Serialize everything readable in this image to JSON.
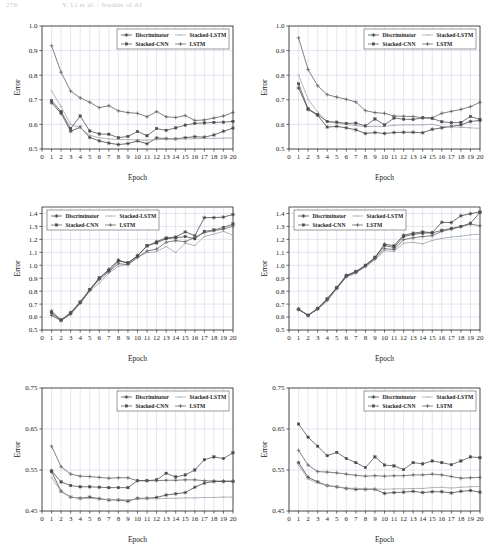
{
  "page": {
    "header_number": "276",
    "header_title": "Y. Li et al. / Studies of AI",
    "axis_x_title": "Epoch",
    "axis_y_title": "Error"
  },
  "legend": {
    "entries": [
      {
        "label": "Discriminator",
        "marker": "star",
        "color": "#3d3d3d"
      },
      {
        "label": "Stacked-LSTM",
        "marker": "thin",
        "color": "#9aa0a6"
      },
      {
        "label": "Stacked-CNN",
        "marker": "square",
        "color": "#4a4a4a"
      },
      {
        "label": "LSTM",
        "marker": "plus",
        "color": "#5a5a5a"
      }
    ]
  },
  "chart_data": [
    {
      "id": "chart-top-left",
      "type": "line",
      "title": "",
      "xlabel": "Epoch",
      "ylabel": "Error",
      "x": [
        1,
        2,
        3,
        4,
        5,
        6,
        7,
        8,
        9,
        10,
        11,
        12,
        13,
        14,
        15,
        16,
        17,
        18,
        19,
        20
      ],
      "xlim": [
        0,
        20
      ],
      "ylim": [
        0.5,
        1.0
      ],
      "yticks": [
        0.5,
        0.6,
        0.7,
        0.8,
        0.9,
        1.0
      ],
      "xticks": [
        0,
        1,
        2,
        3,
        4,
        5,
        6,
        7,
        8,
        9,
        10,
        11,
        12,
        13,
        14,
        15,
        16,
        17,
        18,
        19,
        20
      ],
      "grid": true,
      "legend_position": "top-right",
      "series": [
        {
          "name": "Discriminator",
          "marker": "star",
          "values": [
            0.688,
            0.645,
            0.572,
            0.589,
            0.547,
            0.533,
            0.524,
            0.518,
            0.522,
            0.533,
            0.521,
            0.545,
            0.542,
            0.541,
            0.546,
            0.55,
            0.548,
            0.557,
            0.572,
            0.585
          ]
        },
        {
          "name": "Stacked-LSTM",
          "marker": "thin",
          "values": [
            0.737,
            0.672,
            0.6,
            0.586,
            0.556,
            0.546,
            0.541,
            0.539,
            0.538,
            0.537,
            0.536,
            0.538,
            0.54,
            0.54,
            0.541,
            0.542,
            0.543,
            0.543,
            0.544,
            0.545
          ]
        },
        {
          "name": "Stacked-CNN",
          "marker": "square",
          "values": [
            0.697,
            0.652,
            0.583,
            0.634,
            0.573,
            0.561,
            0.56,
            0.546,
            0.551,
            0.571,
            0.554,
            0.583,
            0.576,
            0.586,
            0.597,
            0.604,
            0.606,
            0.608,
            0.609,
            0.612
          ]
        },
        {
          "name": "LSTM",
          "marker": "plus",
          "values": [
            0.92,
            0.812,
            0.735,
            0.708,
            0.69,
            0.668,
            0.676,
            0.655,
            0.648,
            0.645,
            0.631,
            0.652,
            0.631,
            0.628,
            0.636,
            0.616,
            0.618,
            0.626,
            0.634,
            0.649
          ]
        }
      ]
    },
    {
      "id": "chart-top-right",
      "type": "line",
      "title": "",
      "xlabel": "Epoch",
      "ylabel": "Error",
      "x": [
        1,
        2,
        3,
        4,
        5,
        6,
        7,
        8,
        9,
        10,
        11,
        12,
        13,
        14,
        15,
        16,
        17,
        18,
        19,
        20
      ],
      "xlim": [
        0,
        20
      ],
      "ylim": [
        0.5,
        1.0
      ],
      "yticks": [
        0.5,
        0.6,
        0.7,
        0.8,
        0.9,
        1.0
      ],
      "xticks": [
        0,
        1,
        2,
        3,
        4,
        5,
        6,
        7,
        8,
        9,
        10,
        11,
        12,
        13,
        14,
        15,
        16,
        17,
        18,
        19,
        20
      ],
      "grid": true,
      "legend_position": "top-right",
      "series": [
        {
          "name": "Discriminator",
          "marker": "star",
          "values": [
            0.748,
            0.661,
            0.637,
            0.589,
            0.592,
            0.586,
            0.578,
            0.563,
            0.567,
            0.563,
            0.567,
            0.568,
            0.568,
            0.566,
            0.58,
            0.586,
            0.592,
            0.598,
            0.612,
            0.616
          ]
        },
        {
          "name": "Stacked-LSTM",
          "marker": "thin",
          "values": [
            0.801,
            0.702,
            0.651,
            0.61,
            0.606,
            0.6,
            0.595,
            0.591,
            0.592,
            0.592,
            0.596,
            0.598,
            0.598,
            0.598,
            0.6,
            0.592,
            0.59,
            0.588,
            0.586,
            0.584
          ]
        },
        {
          "name": "Stacked-CNN",
          "marker": "square",
          "values": [
            0.765,
            0.663,
            0.64,
            0.612,
            0.609,
            0.604,
            0.605,
            0.594,
            0.622,
            0.598,
            0.626,
            0.621,
            0.62,
            0.627,
            0.624,
            0.611,
            0.607,
            0.608,
            0.632,
            0.62
          ]
        },
        {
          "name": "LSTM",
          "marker": "plus",
          "values": [
            0.952,
            0.823,
            0.757,
            0.721,
            0.711,
            0.702,
            0.691,
            0.656,
            0.648,
            0.645,
            0.634,
            0.633,
            0.632,
            0.627,
            0.627,
            0.645,
            0.653,
            0.661,
            0.672,
            0.69
          ]
        }
      ]
    },
    {
      "id": "chart-mid-left",
      "type": "line",
      "title": "",
      "xlabel": "Epoch",
      "ylabel": "Error",
      "x": [
        1,
        2,
        3,
        4,
        5,
        6,
        7,
        8,
        9,
        10,
        11,
        12,
        13,
        14,
        15,
        16,
        17,
        18,
        19,
        20
      ],
      "xlim": [
        0,
        20
      ],
      "ylim": [
        0.5,
        1.45
      ],
      "yticks": [
        0.5,
        0.6,
        0.7,
        0.8,
        0.9,
        1.0,
        1.1,
        1.2,
        1.3,
        1.4
      ],
      "xticks": [
        0,
        1,
        2,
        3,
        4,
        5,
        6,
        7,
        8,
        9,
        10,
        11,
        12,
        13,
        14,
        15,
        16,
        17,
        18,
        19,
        20
      ],
      "grid": true,
      "legend_position": "top-left",
      "series": [
        {
          "name": "Discriminator",
          "marker": "star",
          "values": [
            0.645,
            0.575,
            0.635,
            0.718,
            0.812,
            0.9,
            0.968,
            1.04,
            1.015,
            1.075,
            1.148,
            1.182,
            1.212,
            1.218,
            1.258,
            1.228,
            1.368,
            1.368,
            1.372,
            1.392
          ]
        },
        {
          "name": "Stacked-LSTM",
          "marker": "thin",
          "values": [
            0.618,
            0.578,
            0.625,
            0.705,
            0.8,
            0.862,
            0.94,
            0.99,
            1.008,
            1.06,
            1.098,
            1.105,
            1.145,
            1.098,
            1.17,
            1.152,
            1.222,
            1.24,
            1.262,
            1.232
          ]
        },
        {
          "name": "Stacked-CNN",
          "marker": "square",
          "values": [
            0.632,
            0.578,
            0.63,
            0.712,
            0.812,
            0.902,
            0.958,
            1.032,
            1.02,
            1.07,
            1.152,
            1.172,
            1.205,
            1.212,
            1.222,
            1.205,
            1.262,
            1.272,
            1.292,
            1.318
          ]
        },
        {
          "name": "LSTM",
          "marker": "plus",
          "values": [
            0.612,
            0.572,
            0.622,
            0.708,
            0.805,
            0.89,
            0.95,
            1.012,
            1.005,
            1.06,
            1.11,
            1.125,
            1.178,
            1.19,
            1.182,
            1.215,
            1.252,
            1.268,
            1.278,
            1.302
          ]
        }
      ]
    },
    {
      "id": "chart-mid-right",
      "type": "line",
      "title": "",
      "xlabel": "Epoch",
      "ylabel": "Error",
      "x": [
        1,
        2,
        3,
        4,
        5,
        6,
        7,
        8,
        9,
        10,
        11,
        12,
        13,
        14,
        15,
        16,
        17,
        18,
        19,
        20
      ],
      "xlim": [
        0,
        20
      ],
      "ylim": [
        0.5,
        1.45
      ],
      "yticks": [
        0.5,
        0.6,
        0.7,
        0.8,
        0.9,
        1.0,
        1.1,
        1.2,
        1.3,
        1.4
      ],
      "xticks": [
        0,
        1,
        2,
        3,
        4,
        5,
        6,
        7,
        8,
        9,
        10,
        11,
        12,
        13,
        14,
        15,
        16,
        17,
        18,
        19,
        20
      ],
      "grid": true,
      "legend_position": "top-left",
      "series": [
        {
          "name": "Discriminator",
          "marker": "star",
          "values": [
            0.662,
            0.612,
            0.668,
            0.742,
            0.828,
            0.922,
            0.952,
            1.0,
            1.062,
            1.162,
            1.152,
            1.232,
            1.248,
            1.258,
            1.252,
            1.332,
            1.33,
            1.382,
            1.398,
            1.412
          ]
        },
        {
          "name": "Stacked-LSTM",
          "marker": "thin",
          "values": [
            0.655,
            0.618,
            0.658,
            0.722,
            0.818,
            0.908,
            0.94,
            0.988,
            1.042,
            1.112,
            1.108,
            1.17,
            1.178,
            1.165,
            1.192,
            1.208,
            1.218,
            1.225,
            1.235,
            1.24
          ]
        },
        {
          "name": "Stacked-CNN",
          "marker": "square",
          "values": [
            0.66,
            0.612,
            0.665,
            0.738,
            0.825,
            0.918,
            0.948,
            0.998,
            1.058,
            1.152,
            1.138,
            1.222,
            1.238,
            1.248,
            1.25,
            1.27,
            1.285,
            1.3,
            1.325,
            1.408
          ]
        },
        {
          "name": "LSTM",
          "marker": "plus",
          "values": [
            0.658,
            0.615,
            0.662,
            0.732,
            0.822,
            0.912,
            0.945,
            0.992,
            1.05,
            1.128,
            1.122,
            1.198,
            1.212,
            1.222,
            1.228,
            1.262,
            1.278,
            1.298,
            1.318,
            1.305
          ]
        }
      ]
    },
    {
      "id": "chart-bot-left",
      "type": "line",
      "title": "",
      "xlabel": "Epoch",
      "ylabel": "Error",
      "x": [
        1,
        2,
        3,
        4,
        5,
        6,
        7,
        8,
        9,
        10,
        11,
        12,
        13,
        14,
        15,
        16,
        17,
        18,
        19,
        20
      ],
      "xlim": [
        0,
        20
      ],
      "ylim": [
        0.45,
        0.75
      ],
      "yticks": [
        0.45,
        0.55,
        0.65,
        0.75
      ],
      "xticks": [
        0,
        1,
        2,
        3,
        4,
        5,
        6,
        7,
        8,
        9,
        10,
        11,
        12,
        13,
        14,
        15,
        16,
        17,
        18,
        19,
        20
      ],
      "grid": true,
      "legend_position": "top-right",
      "series": [
        {
          "name": "Discriminator",
          "marker": "star",
          "values": [
            0.546,
            0.498,
            0.484,
            0.481,
            0.484,
            0.48,
            0.477,
            0.477,
            0.474,
            0.481,
            0.481,
            0.483,
            0.489,
            0.492,
            0.495,
            0.508,
            0.518,
            0.522,
            0.522,
            0.522
          ]
        },
        {
          "name": "Stacked-LSTM",
          "marker": "thin",
          "values": [
            0.532,
            0.497,
            0.484,
            0.481,
            0.481,
            0.479,
            0.478,
            0.478,
            0.477,
            0.479,
            0.48,
            0.48,
            0.481,
            0.481,
            0.482,
            0.482,
            0.483,
            0.483,
            0.484,
            0.484
          ]
        },
        {
          "name": "Stacked-CNN",
          "marker": "square",
          "values": [
            0.548,
            0.521,
            0.512,
            0.509,
            0.509,
            0.508,
            0.507,
            0.507,
            0.507,
            0.524,
            0.524,
            0.526,
            0.542,
            0.533,
            0.538,
            0.55,
            0.575,
            0.582,
            0.578,
            0.592
          ]
        },
        {
          "name": "LSTM",
          "marker": "plus",
          "values": [
            0.608,
            0.558,
            0.54,
            0.535,
            0.534,
            0.532,
            0.53,
            0.531,
            0.531,
            0.524,
            0.524,
            0.524,
            0.525,
            0.525,
            0.526,
            0.526,
            0.524,
            0.523,
            0.523,
            0.523
          ]
        }
      ]
    },
    {
      "id": "chart-bot-right",
      "type": "line",
      "title": "",
      "xlabel": "Epoch",
      "ylabel": "Error",
      "x": [
        1,
        2,
        3,
        4,
        5,
        6,
        7,
        8,
        9,
        10,
        11,
        12,
        13,
        14,
        15,
        16,
        17,
        18,
        19,
        20
      ],
      "xlim": [
        0,
        20
      ],
      "ylim": [
        0.45,
        0.75
      ],
      "yticks": [
        0.45,
        0.55,
        0.65,
        0.75
      ],
      "xticks": [
        0,
        1,
        2,
        3,
        4,
        5,
        6,
        7,
        8,
        9,
        10,
        11,
        12,
        13,
        14,
        15,
        16,
        17,
        18,
        19,
        20
      ],
      "grid": true,
      "legend_position": "top-right",
      "series": [
        {
          "name": "Discriminator",
          "marker": "star",
          "values": [
            0.568,
            0.532,
            0.521,
            0.512,
            0.509,
            0.505,
            0.503,
            0.503,
            0.503,
            0.493,
            0.495,
            0.496,
            0.498,
            0.495,
            0.497,
            0.497,
            0.494,
            0.498,
            0.5,
            0.496
          ]
        },
        {
          "name": "Stacked-LSTM",
          "marker": "thin",
          "values": [
            0.562,
            0.528,
            0.518,
            0.512,
            0.509,
            0.506,
            0.505,
            0.504,
            0.504,
            0.503,
            0.504,
            0.504,
            0.505,
            0.505,
            0.507,
            0.508,
            0.506,
            0.508,
            0.509,
            0.51
          ]
        },
        {
          "name": "Stacked-CNN",
          "marker": "square",
          "values": [
            0.662,
            0.63,
            0.608,
            0.585,
            0.593,
            0.578,
            0.568,
            0.556,
            0.582,
            0.562,
            0.56,
            0.551,
            0.568,
            0.565,
            0.572,
            0.568,
            0.563,
            0.572,
            0.582,
            0.58
          ]
        },
        {
          "name": "LSTM",
          "marker": "plus",
          "values": [
            0.598,
            0.562,
            0.546,
            0.545,
            0.543,
            0.54,
            0.537,
            0.535,
            0.536,
            0.535,
            0.536,
            0.536,
            0.538,
            0.538,
            0.54,
            0.538,
            0.534,
            0.53,
            0.531,
            0.532
          ]
        }
      ]
    }
  ]
}
